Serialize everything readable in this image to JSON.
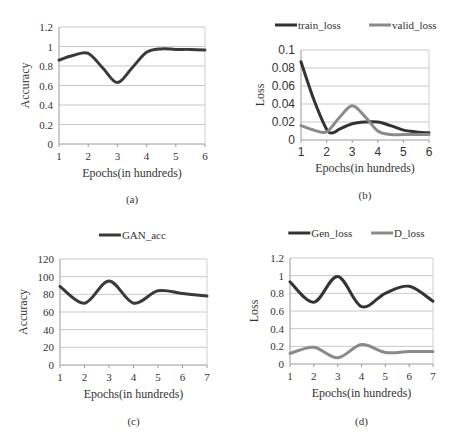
{
  "chart_data": [
    {
      "id": "a",
      "type": "line",
      "caption": "(a)",
      "title": "",
      "xlabel": "Epochs(in hundreds)",
      "ylabel": "Accuracy",
      "xlim": [
        1,
        6
      ],
      "ylim": [
        0,
        1.2
      ],
      "xticks": [
        "1",
        "2",
        "3",
        "4",
        "5",
        "6"
      ],
      "yticks": [
        "0",
        "0.2",
        "0.4",
        "0.6",
        "0.8",
        "1",
        "1.2"
      ],
      "grid": true,
      "legend": null,
      "series": [
        {
          "name": "Accuracy",
          "color": "#3a3a3a",
          "x": [
            1,
            1.5,
            2,
            2.5,
            3,
            3.5,
            4,
            4.5,
            5,
            5.5,
            6
          ],
          "values": [
            0.86,
            0.91,
            0.93,
            0.78,
            0.63,
            0.78,
            0.94,
            0.975,
            0.97,
            0.97,
            0.965
          ]
        }
      ]
    },
    {
      "id": "b",
      "type": "line",
      "caption": "(b)",
      "title": "",
      "xlabel": "Epochs(in hundreds)",
      "ylabel": "Loss",
      "xlim": [
        1,
        6
      ],
      "ylim": [
        0,
        0.1
      ],
      "xticks": [
        "1",
        "2",
        "3",
        "4",
        "5",
        "6"
      ],
      "yticks": [
        "0",
        "0.02",
        "0.04",
        "0.06",
        "0.08",
        "0.1"
      ],
      "grid": true,
      "legend": "top",
      "series": [
        {
          "name": "train_loss",
          "color": "#333333",
          "x": [
            1,
            1.5,
            2,
            2.25,
            2.5,
            3,
            3.5,
            4,
            4.5,
            5,
            5.5,
            6
          ],
          "values": [
            0.087,
            0.045,
            0.012,
            0.008,
            0.012,
            0.018,
            0.02,
            0.02,
            0.016,
            0.011,
            0.009,
            0.008
          ]
        },
        {
          "name": "valid_loss",
          "color": "#8a8a8a",
          "x": [
            1,
            1.5,
            2,
            2.5,
            3,
            3.5,
            4,
            4.5,
            5,
            5.5,
            6
          ],
          "values": [
            0.016,
            0.011,
            0.009,
            0.025,
            0.038,
            0.026,
            0.01,
            0.006,
            0.006,
            0.006,
            0.006
          ]
        }
      ]
    },
    {
      "id": "c",
      "type": "line",
      "caption": "(c)",
      "title": "",
      "xlabel": "Epochs(in hundreds)",
      "ylabel": "Accuracy",
      "xlim": [
        1,
        7
      ],
      "ylim": [
        0,
        120
      ],
      "xticks": [
        "1",
        "2",
        "3",
        "4",
        "5",
        "6",
        "7"
      ],
      "yticks": [
        "0",
        "20",
        "40",
        "60",
        "80",
        "100",
        "120"
      ],
      "grid": true,
      "legend": "top",
      "series": [
        {
          "name": "GAN_acc",
          "color": "#3a3a3a",
          "x": [
            1,
            2,
            3,
            4,
            5,
            6,
            7
          ],
          "values": [
            89,
            70,
            95,
            70,
            84,
            81,
            78
          ]
        }
      ]
    },
    {
      "id": "d",
      "type": "line",
      "caption": "(d)",
      "title": "",
      "xlabel": "Epochs(in hundreds)",
      "ylabel": "Loss",
      "xlim": [
        1,
        7
      ],
      "ylim": [
        0,
        1.2
      ],
      "xticks": [
        "1",
        "2",
        "3",
        "4",
        "5",
        "6",
        "7"
      ],
      "yticks": [
        "0",
        "0.2",
        "0.4",
        "0.6",
        "0.8",
        "1",
        "1.2"
      ],
      "grid": true,
      "legend": "top",
      "series": [
        {
          "name": "Gen_loss",
          "color": "#333333",
          "x": [
            1,
            2,
            3,
            4,
            5,
            6,
            7
          ],
          "values": [
            0.93,
            0.7,
            0.99,
            0.65,
            0.8,
            0.88,
            0.71
          ]
        },
        {
          "name": "D_loss",
          "color": "#8a8a8a",
          "x": [
            1,
            2,
            3,
            4,
            5,
            6,
            7
          ],
          "values": [
            0.12,
            0.19,
            0.07,
            0.22,
            0.13,
            0.14,
            0.14
          ]
        }
      ]
    }
  ]
}
